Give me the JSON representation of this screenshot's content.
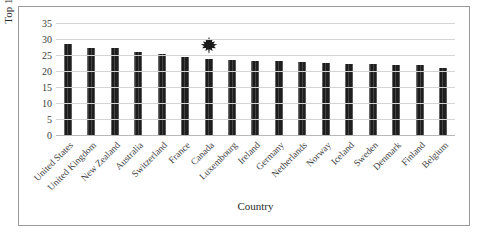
{
  "figure": {
    "top_cropped_text": "",
    "frame_color": "#9a9a9a",
    "bar_color": "#2a2a2a",
    "gridline_color": "#d4d4d4",
    "highlight_icon": "maple-leaf-icon",
    "highlight_country": "Canada"
  },
  "chart_data": {
    "type": "bar",
    "title": "",
    "xlabel": "Country",
    "ylabel": "Top 10% Income Share",
    "ylim": [
      0,
      35
    ],
    "yticks": [
      0,
      5,
      10,
      15,
      20,
      25,
      30,
      35
    ],
    "ytick_labels": [
      "0",
      "5",
      "10",
      "15",
      "20",
      "25",
      "30",
      "35"
    ],
    "grid": true,
    "legend": "none",
    "categories": [
      "United States",
      "United Kingdom",
      "New Zealand",
      "Australia",
      "Switzerland",
      "France",
      "Canada",
      "Luxembourg",
      "Ireland",
      "Germany",
      "Netherlands",
      "Norway",
      "Iceland",
      "Sweden",
      "Denmark",
      "Finland",
      "Belgium"
    ],
    "values": [
      28.8,
      27.6,
      27.4,
      26.1,
      25.7,
      24.6,
      24.0,
      23.9,
      23.5,
      23.3,
      23.2,
      22.9,
      22.6,
      22.5,
      22.3,
      22.1,
      21.2
    ],
    "annotations": [
      {
        "category": "Canada",
        "icon": "maple-leaf-icon"
      }
    ]
  }
}
